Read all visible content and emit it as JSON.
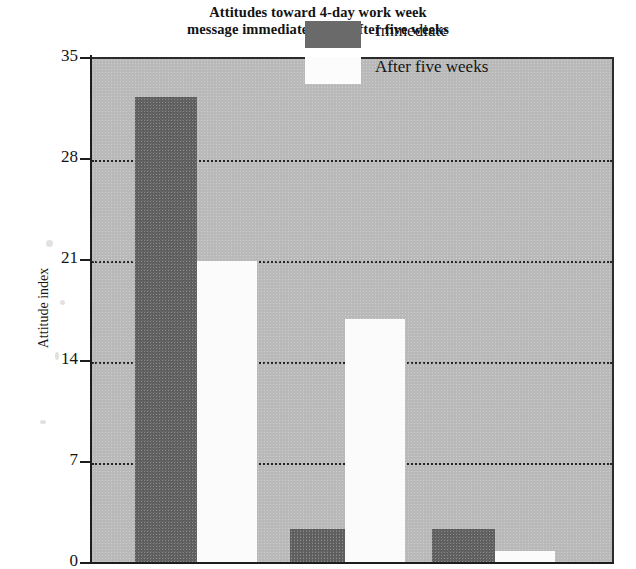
{
  "chart_data": {
    "type": "bar",
    "title": "Attitudes toward 4-day work week\nmessage immediately and after five weeks",
    "title_lines": [
      "Attitudes toward 4-day work week",
      "message immediately and after five weeks"
    ],
    "xlabel": "",
    "ylabel": "Attitude index",
    "ylim": [
      0,
      35
    ],
    "yticks": [
      0,
      7,
      14,
      21,
      28,
      35
    ],
    "ytick_labels": [
      "0",
      "7",
      "14",
      "21",
      "28",
      "35"
    ],
    "grid": true,
    "grid_axis": "y",
    "grid_style": "dotted",
    "legend_position": "top-right",
    "categories": [
      "Group 1",
      "Group 2"
    ],
    "series": [
      {
        "name": "Immediate",
        "color": "#5e5e5e",
        "values": [
          32.4,
          2.4
        ]
      },
      {
        "name": "After five weeks",
        "color": "#fbfbfb",
        "values": [
          21.0,
          0.9
        ]
      }
    ],
    "bars": [
      {
        "series": "Immediate",
        "group": 1,
        "value": 32.4,
        "x": 135,
        "width": 62,
        "fill": "#5e5e5e"
      },
      {
        "series": "After five weeks",
        "group": 1,
        "value": 21.0,
        "x": 197,
        "width": 60,
        "fill": "#fbfbfb"
      },
      {
        "series": "Immediate",
        "group": 2,
        "value": 2.4,
        "x": 290,
        "width": 55,
        "fill": "#5e5e5e"
      },
      {
        "series": "After five weeks",
        "group": 2,
        "value": 17.0,
        "x": 345,
        "width": 60,
        "fill": "#fbfbfb"
      },
      {
        "series": "Immediate",
        "group": 3,
        "value": 2.4,
        "x": 432,
        "width": 63,
        "fill": "#5e5e5e"
      },
      {
        "series": "After five weeks",
        "group": 3,
        "value": 0.9,
        "x": 495,
        "width": 60,
        "fill": "#fbfbfb"
      }
    ],
    "plot_background_color": "#b9b9b9",
    "axis_color": "#1d1d1d"
  },
  "legend": {
    "items": [
      {
        "label": "Immediate",
        "swatch": "immediate"
      },
      {
        "label": "After five weeks",
        "swatch": "after"
      }
    ]
  }
}
